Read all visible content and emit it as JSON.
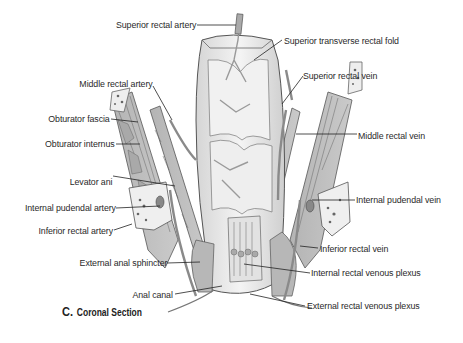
{
  "figure": {
    "caption_letter": "C.",
    "caption_title": "Coronal Section"
  },
  "labels": {
    "superior_rectal_artery": "Superior rectal artery",
    "superior_transverse_rectal_fold": "Superior transverse rectal fold",
    "superior_rectal_vein": "Superior rectal vein",
    "middle_rectal_artery": "Middle rectal artery",
    "obturator_fascia": "Obturator fascia",
    "obturator_internus": "Obturator internus",
    "middle_rectal_vein": "Middle rectal vein",
    "levator_ani": "Levator ani",
    "internal_pudendal_artery": "Internal pudendal artery",
    "internal_pudendal_vein": "Internal pudendal vein",
    "inferior_rectal_artery": "Inferior rectal artery",
    "inferior_rectal_vein": "Inferior rectal vein",
    "external_anal_sphincter": "External anal sphincter",
    "internal_rectal_venous_plexus": "Internal rectal venous plexus",
    "anal_canal": "Anal canal",
    "external_rectal_venous_plexus": "External rectal venous plexus"
  },
  "colors": {
    "tissue_fill": "#e6e6e6",
    "muscle_fill": "#bdbdbd",
    "vessel": "#8c8c8c",
    "outline": "#5a5a5a",
    "text": "#2a2a2a"
  }
}
